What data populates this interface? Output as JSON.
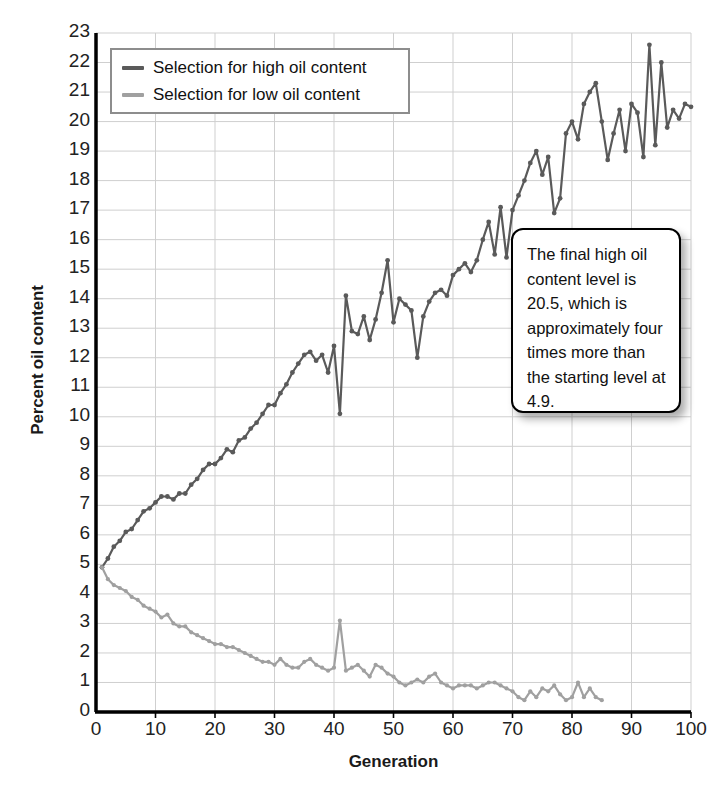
{
  "chart_data": {
    "type": "line",
    "title": "",
    "xlabel": "Generation",
    "ylabel": "Percent oil content",
    "xlim": [
      0,
      100
    ],
    "ylim": [
      0,
      23
    ],
    "xticks": [
      0,
      10,
      20,
      30,
      40,
      50,
      60,
      70,
      80,
      90,
      100
    ],
    "yticks": [
      0,
      1,
      2,
      3,
      4,
      5,
      6,
      7,
      8,
      9,
      10,
      11,
      12,
      13,
      14,
      15,
      16,
      17,
      18,
      19,
      20,
      21,
      22,
      23
    ],
    "grid": true,
    "legend_position": "top-left",
    "series": [
      {
        "name": "Selection for high oil content",
        "color": "#5a5a5a",
        "x": [
          1,
          2,
          3,
          4,
          5,
          6,
          7,
          8,
          9,
          10,
          11,
          12,
          13,
          14,
          15,
          16,
          17,
          18,
          19,
          20,
          21,
          22,
          23,
          24,
          25,
          26,
          27,
          28,
          29,
          30,
          31,
          32,
          33,
          34,
          35,
          36,
          37,
          38,
          39,
          40,
          41,
          42,
          43,
          44,
          45,
          46,
          47,
          48,
          49,
          50,
          51,
          52,
          53,
          54,
          55,
          56,
          57,
          58,
          59,
          60,
          61,
          62,
          63,
          64,
          65,
          66,
          67,
          68,
          69,
          70,
          71,
          72,
          73,
          74,
          75,
          76,
          77,
          78,
          79,
          80,
          81,
          82,
          83,
          84,
          85,
          86,
          87,
          88,
          89,
          90,
          91,
          92,
          93,
          94,
          95,
          96,
          97,
          98,
          99,
          100
        ],
        "values": [
          4.9,
          5.2,
          5.6,
          5.8,
          6.1,
          6.2,
          6.5,
          6.8,
          6.9,
          7.1,
          7.3,
          7.3,
          7.2,
          7.4,
          7.4,
          7.7,
          7.9,
          8.2,
          8.4,
          8.4,
          8.6,
          8.9,
          8.8,
          9.2,
          9.3,
          9.6,
          9.8,
          10.1,
          10.4,
          10.4,
          10.8,
          11.1,
          11.5,
          11.8,
          12.1,
          12.2,
          11.9,
          12.1,
          11.5,
          12.4,
          10.1,
          14.1,
          12.9,
          12.8,
          13.4,
          12.6,
          13.3,
          14.2,
          15.3,
          13.2,
          14.0,
          13.8,
          13.6,
          12.0,
          13.4,
          13.9,
          14.2,
          14.3,
          14.1,
          14.8,
          15.0,
          15.2,
          14.9,
          15.3,
          16.0,
          16.6,
          15.5,
          17.1,
          15.4,
          17.0,
          17.5,
          18.0,
          18.6,
          19.0,
          18.2,
          18.8,
          16.9,
          17.4,
          19.6,
          20.0,
          19.4,
          20.6,
          21.0,
          21.3,
          20.0,
          18.7,
          19.6,
          20.4,
          19.0,
          20.6,
          20.3,
          18.8,
          22.6,
          19.2,
          22.0,
          19.8,
          20.4,
          20.1,
          20.6,
          20.5
        ]
      },
      {
        "name": "Selection for low oil content",
        "color": "#a0a0a0",
        "x": [
          1,
          2,
          3,
          4,
          5,
          6,
          7,
          8,
          9,
          10,
          11,
          12,
          13,
          14,
          15,
          16,
          17,
          18,
          19,
          20,
          21,
          22,
          23,
          24,
          25,
          26,
          27,
          28,
          29,
          30,
          31,
          32,
          33,
          34,
          35,
          36,
          37,
          38,
          39,
          40,
          41,
          42,
          43,
          44,
          45,
          46,
          47,
          48,
          49,
          50,
          51,
          52,
          53,
          54,
          55,
          56,
          57,
          58,
          59,
          60,
          61,
          62,
          63,
          64,
          65,
          66,
          67,
          68,
          69,
          70,
          71,
          72,
          73,
          74,
          75,
          76,
          77,
          78,
          79,
          80,
          81,
          82,
          83,
          84,
          85
        ],
        "values": [
          4.9,
          4.5,
          4.3,
          4.2,
          4.1,
          3.9,
          3.8,
          3.6,
          3.5,
          3.4,
          3.2,
          3.3,
          3.0,
          2.9,
          2.9,
          2.7,
          2.6,
          2.5,
          2.4,
          2.3,
          2.3,
          2.2,
          2.2,
          2.1,
          2.0,
          1.9,
          1.8,
          1.7,
          1.7,
          1.6,
          1.8,
          1.6,
          1.5,
          1.5,
          1.7,
          1.8,
          1.6,
          1.5,
          1.4,
          1.5,
          3.1,
          1.4,
          1.5,
          1.6,
          1.4,
          1.2,
          1.6,
          1.5,
          1.3,
          1.2,
          1.0,
          0.9,
          1.0,
          1.1,
          1.0,
          1.2,
          1.3,
          1.0,
          0.9,
          0.8,
          0.9,
          0.9,
          0.9,
          0.8,
          0.9,
          1.0,
          1.0,
          0.9,
          0.8,
          0.7,
          0.5,
          0.4,
          0.7,
          0.5,
          0.8,
          0.7,
          0.9,
          0.6,
          0.4,
          0.5,
          1.0,
          0.5,
          0.8,
          0.5,
          0.4
        ]
      }
    ],
    "annotation": "The final high oil content level is 20.5, which is approximately four times more than the starting level at 4.9."
  },
  "legend": {
    "items": [
      {
        "label": "Selection for high oil content",
        "color": "#5a5a5a"
      },
      {
        "label": "Selection for low oil content",
        "color": "#a0a0a0"
      }
    ]
  },
  "axes": {
    "x_title": "Generation",
    "y_title": "Percent oil content",
    "x_ticks": [
      "0",
      "10",
      "20",
      "30",
      "40",
      "50",
      "60",
      "70",
      "80",
      "90",
      "100"
    ],
    "y_ticks": [
      "23",
      "22",
      "21",
      "20",
      "19",
      "18",
      "17",
      "16",
      "15",
      "14",
      "13",
      "12",
      "11",
      "10",
      "9",
      "8",
      "7",
      "6",
      "5",
      "4",
      "3",
      "2",
      "1",
      "0"
    ]
  },
  "callout": {
    "text": "The final high oil content level is 20.5, which is approximately four times more than the starting level at 4.9."
  },
  "colors": {
    "high_series": "#5a5a5a",
    "low_series": "#a0a0a0",
    "grid": "#cfcfcf",
    "axis": "#000000",
    "background": "#ffffff"
  }
}
